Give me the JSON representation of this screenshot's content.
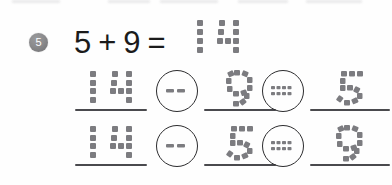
{
  "worksheet": {
    "problem_number": "5",
    "equation": {
      "left_operand": "5",
      "plus_sign": "+",
      "right_operand": "9",
      "equals_sign": "=",
      "answer_written": "14",
      "full_text": "5 + 9 = 14"
    },
    "fact_family_rows": [
      {
        "row_label": "fact-family-row-1",
        "cells": [
          {
            "kind": "number",
            "value": "14",
            "name": "minuend"
          },
          {
            "kind": "operator",
            "value": "−",
            "name": "minus-operator"
          },
          {
            "kind": "number",
            "value": "9",
            "name": "subtrahend"
          },
          {
            "kind": "operator",
            "value": "=",
            "name": "equals-operator"
          },
          {
            "kind": "number",
            "value": "5",
            "name": "difference"
          }
        ],
        "sentence": "14 − 9 = 5"
      },
      {
        "row_label": "fact-family-row-2",
        "cells": [
          {
            "kind": "number",
            "value": "14",
            "name": "minuend"
          },
          {
            "kind": "operator",
            "value": "−",
            "name": "minus-operator"
          },
          {
            "kind": "number",
            "value": "5",
            "name": "subtrahend"
          },
          {
            "kind": "operator",
            "value": "=",
            "name": "equals-operator"
          },
          {
            "kind": "number",
            "value": "9",
            "name": "difference"
          }
        ],
        "sentence": "14 − 5 = 9"
      }
    ],
    "style_notes": {
      "handwriting_style": "dotted-tracing",
      "trace_color": "#7c7c80",
      "ink_color": "#1b1b1b",
      "rule_color": "#4a4a4e",
      "badge_color": "#8b8b8d",
      "badge_text_color": "#ffffff",
      "page_background": "#fefefe"
    }
  }
}
